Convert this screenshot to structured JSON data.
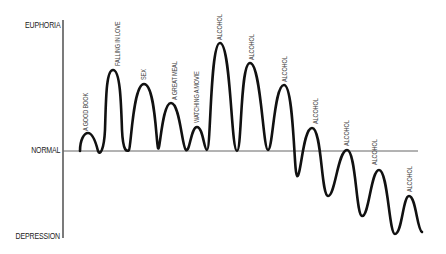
{
  "diagram": {
    "type": "emotional-state-curve",
    "y_axis_labels": {
      "top": "EUPHORIA",
      "middle": "NORMAL",
      "bottom": "DEPRESSION"
    },
    "peaks": [
      {
        "label": "A GOOD BOOK"
      },
      {
        "label": "FALLING IN LOVE"
      },
      {
        "label": "SEX"
      },
      {
        "label": "A GREAT MEAL"
      },
      {
        "label": "WATCHING A MOVIE"
      },
      {
        "label": "ALCOHOL"
      },
      {
        "label": "ALCOHOL"
      },
      {
        "label": "ALCOHOL"
      },
      {
        "label": "ALCOHOL"
      },
      {
        "label": "ALCOHOL"
      },
      {
        "label": "ALCOHOL"
      },
      {
        "label": "ALCOHOL"
      }
    ],
    "colors": {
      "curve": "#111111",
      "axis": "#333333",
      "baseline": "#666666",
      "text": "#222222"
    }
  }
}
